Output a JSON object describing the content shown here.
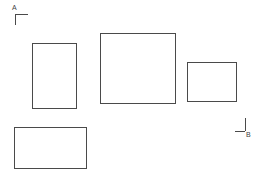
{
  "canvas": {
    "width": 268,
    "height": 177,
    "background_color": "#ffffff",
    "line_color": "#4a4a4a",
    "text_color": "#3f3f3f"
  },
  "drawing": {
    "title": "Rectangle layout line drawing",
    "shape_count": 4,
    "shapes": [
      {
        "id": "rect-1",
        "label": "rectangle-tall-left",
        "x": 32,
        "y": 43,
        "width": 45,
        "height": 66,
        "stroke": "#4a4a4a",
        "stroke_width": 1,
        "fill": "none"
      },
      {
        "id": "rect-2",
        "label": "rectangle-large-center",
        "x": 100,
        "y": 33,
        "width": 76,
        "height": 71,
        "stroke": "#4a4a4a",
        "stroke_width": 1,
        "fill": "none"
      },
      {
        "id": "rect-3",
        "label": "rectangle-small-right",
        "x": 187,
        "y": 62,
        "width": 50,
        "height": 40,
        "stroke": "#4a4a4a",
        "stroke_width": 1,
        "fill": "none"
      },
      {
        "id": "rect-4",
        "label": "rectangle-wide-bottom-left",
        "x": 14,
        "y": 127,
        "width": 73,
        "height": 42,
        "stroke": "#4a4a4a",
        "stroke_width": 1,
        "fill": "none"
      }
    ],
    "markers": [
      {
        "id": "marker-a",
        "label": "A",
        "corner": "top-left",
        "label_x": 12,
        "label_y": 4,
        "corner_x": 15,
        "corner_y": 14,
        "arm_h": 13,
        "arm_v": 11
      },
      {
        "id": "marker-b",
        "label": "B",
        "corner": "bottom-right",
        "label_x": 246,
        "label_y": 131,
        "corner_x": 245,
        "corner_y": 131,
        "arm_h": 10,
        "arm_v": 13
      }
    ]
  }
}
